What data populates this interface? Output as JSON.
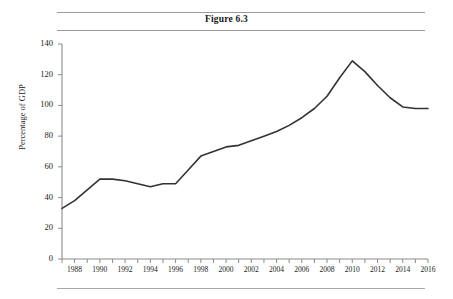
{
  "figure": {
    "title": "Figure 6.3"
  },
  "chart_data": {
    "type": "line",
    "title": "Figure 6.3",
    "xlabel": "",
    "ylabel": "Percentage of GDP",
    "xlim": [
      1987,
      2016
    ],
    "ylim": [
      0,
      140
    ],
    "y_ticks": [
      0,
      20,
      40,
      60,
      80,
      100,
      120,
      140
    ],
    "x_ticks": [
      1987,
      1988,
      1989,
      1990,
      1991,
      1992,
      1993,
      1994,
      1995,
      1996,
      1997,
      1998,
      1999,
      2000,
      2001,
      2002,
      2003,
      2004,
      2005,
      2006,
      2007,
      2008,
      2009,
      2010,
      2011,
      2012,
      2013,
      2014,
      2015,
      2016
    ],
    "x_tick_labels": [
      "1988",
      "1990",
      "1992",
      "1994",
      "1996",
      "1998",
      "2000",
      "2002",
      "2004",
      "2006",
      "2008",
      "2010",
      "2012",
      "2014",
      "2016"
    ],
    "x_tick_labels_years": [
      1988,
      1990,
      1992,
      1994,
      1996,
      1998,
      2000,
      2002,
      2004,
      2006,
      2008,
      2010,
      2012,
      2014,
      2016
    ],
    "grid": false,
    "legend": false,
    "line_color": "#333333",
    "axis_color": "#8c8c8c",
    "x": [
      1987,
      1988,
      1989,
      1990,
      1991,
      1992,
      1993,
      1994,
      1995,
      1996,
      1997,
      1998,
      1999,
      2000,
      2001,
      2002,
      2003,
      2004,
      2005,
      2006,
      2007,
      2008,
      2009,
      2010,
      2011,
      2012,
      2013,
      2014,
      2015,
      2016
    ],
    "values": [
      33,
      38,
      45,
      52,
      52,
      51,
      49,
      47,
      49,
      49,
      58,
      67,
      70,
      73,
      74,
      77,
      80,
      83,
      87,
      92,
      98,
      106,
      118,
      129,
      122,
      113,
      105,
      99,
      98,
      98
    ],
    "series": [
      {
        "name": "Percentage of GDP",
        "values": [
          33,
          38,
          45,
          52,
          52,
          51,
          49,
          47,
          49,
          49,
          58,
          67,
          70,
          73,
          74,
          77,
          80,
          83,
          87,
          92,
          98,
          106,
          118,
          129,
          122,
          113,
          105,
          99,
          98,
          98
        ]
      }
    ]
  }
}
